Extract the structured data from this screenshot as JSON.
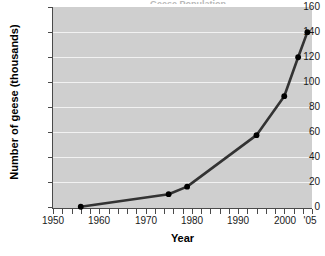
{
  "chart_data": {
    "type": "line",
    "title": "",
    "title_clipped_text": "Geese Population",
    "xlabel": "Year",
    "ylabel": "Number of geese (thousands)",
    "xlim": [
      1950,
      2006
    ],
    "ylim": [
      0,
      160
    ],
    "y_ticks": [
      0,
      20,
      40,
      60,
      80,
      100,
      120,
      140,
      160
    ],
    "x_ticks": [
      1950,
      1960,
      1970,
      1980,
      1990,
      2000,
      2005
    ],
    "x_tick_labels": [
      "1950",
      "1960",
      "1970",
      "1980",
      "1990",
      "2000",
      "'05"
    ],
    "x_minor_tick_step": 2,
    "grid": true,
    "grid_axis": "y",
    "legend": false,
    "plot_background": "#cfcfcf",
    "gridline_color": "#f2f2f2",
    "line_color": "#333333",
    "marker_color": "#000000",
    "series": [
      {
        "name": "Number of geese (thousands)",
        "x": [
          1956,
          1975,
          1979,
          1994,
          2000,
          2003,
          2005
        ],
        "values": [
          1,
          11,
          17,
          58,
          89,
          120,
          140
        ]
      }
    ]
  },
  "axes": {
    "y_label_text": "Number of geese (thousands)",
    "x_label_text": "Year"
  }
}
